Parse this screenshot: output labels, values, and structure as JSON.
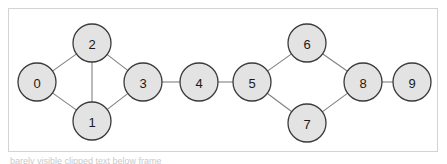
{
  "figure": {
    "kind": "undirected-graph-diagram",
    "background_color": "#ffffff",
    "frame": {
      "border_color": "#d3d3d3",
      "fill_color": "#ffffff",
      "x": 8,
      "y": 8,
      "width": 430,
      "height": 144
    },
    "node_style": {
      "fill_color": "#e3e3e3",
      "stroke_color": "#3a3a3a",
      "label_color": "#1a1a1a",
      "radius": 19
    },
    "edge_style": {
      "stroke_color": "#808080"
    },
    "caption_bleed": "barely visible clipped text below frame"
  },
  "graph": {
    "node_count": 10,
    "edge_count": 11,
    "nodes": [
      {
        "id": "0",
        "label": "0",
        "x": 37,
        "y": 82
      },
      {
        "id": "1",
        "label": "1",
        "x": 92,
        "y": 121
      },
      {
        "id": "2",
        "label": "2",
        "x": 92,
        "y": 43
      },
      {
        "id": "3",
        "label": "3",
        "x": 143,
        "y": 82
      },
      {
        "id": "4",
        "label": "4",
        "x": 199,
        "y": 82
      },
      {
        "id": "5",
        "label": "5",
        "x": 252,
        "y": 82
      },
      {
        "id": "6",
        "label": "6",
        "x": 307,
        "y": 43
      },
      {
        "id": "7",
        "label": "7",
        "x": 307,
        "y": 123
      },
      {
        "id": "8",
        "label": "8",
        "x": 363,
        "y": 82
      },
      {
        "id": "9",
        "label": "9",
        "x": 412,
        "y": 82
      }
    ],
    "edges": [
      {
        "source": "0",
        "target": "2"
      },
      {
        "source": "0",
        "target": "1"
      },
      {
        "source": "2",
        "target": "1"
      },
      {
        "source": "2",
        "target": "3"
      },
      {
        "source": "1",
        "target": "3"
      },
      {
        "source": "3",
        "target": "4"
      },
      {
        "source": "4",
        "target": "5"
      },
      {
        "source": "5",
        "target": "6"
      },
      {
        "source": "5",
        "target": "7"
      },
      {
        "source": "6",
        "target": "8"
      },
      {
        "source": "7",
        "target": "8"
      },
      {
        "source": "8",
        "target": "9"
      }
    ]
  }
}
